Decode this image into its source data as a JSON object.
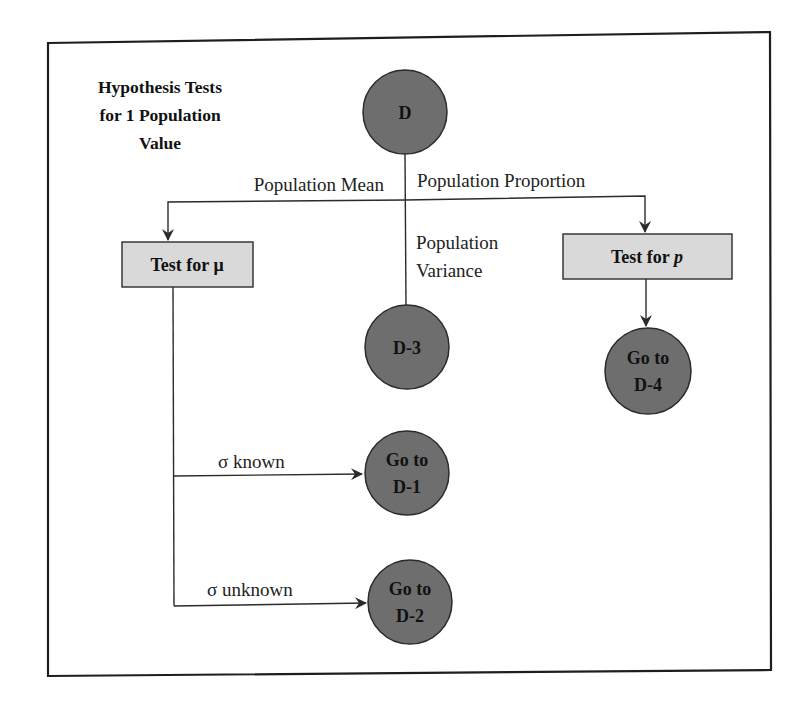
{
  "title": {
    "lines": [
      "Hypothesis Tests",
      "for 1 Population",
      "Value"
    ]
  },
  "nodes": {
    "root": {
      "label": "D"
    },
    "test_mu": {
      "label": "Test for μ"
    },
    "test_p": {
      "label_prefix": "Test for ",
      "label_var": "p"
    },
    "d3": {
      "label": "D-3"
    },
    "d4": {
      "lines": [
        "Go to",
        "D-4"
      ]
    },
    "d1": {
      "lines": [
        "Go to",
        "D-1"
      ]
    },
    "d2": {
      "lines": [
        "Go to",
        "D-2"
      ]
    }
  },
  "edges": {
    "population_mean": "Population Mean",
    "population_proportion": "Population Proportion",
    "population_variance": [
      "Population",
      "Variance"
    ],
    "sigma_known": "σ known",
    "sigma_unknown": "σ unknown"
  },
  "colors": {
    "circle_fill": "#6e6e6e",
    "circle_stroke": "#2b2b2b",
    "box_fill": "#d9d9d9",
    "box_stroke": "#2b2b2b",
    "line": "#2b2b2b",
    "frame": "#1e1e1e"
  }
}
